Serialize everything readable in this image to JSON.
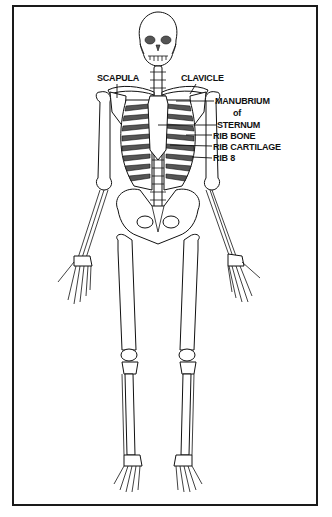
{
  "diagram": {
    "labels": {
      "scapula": "SCAPULA",
      "clavicle": "CLAVICLE",
      "manubrium": "MANUBRIUM",
      "of": "of",
      "sternum": "STERNUM",
      "rib_bone": "RIB BONE",
      "rib_cartilage": "RIB CARTILAGE",
      "rib_8": "RIB 8"
    },
    "colors": {
      "ink": "#111111",
      "background": "#ffffff"
    }
  }
}
